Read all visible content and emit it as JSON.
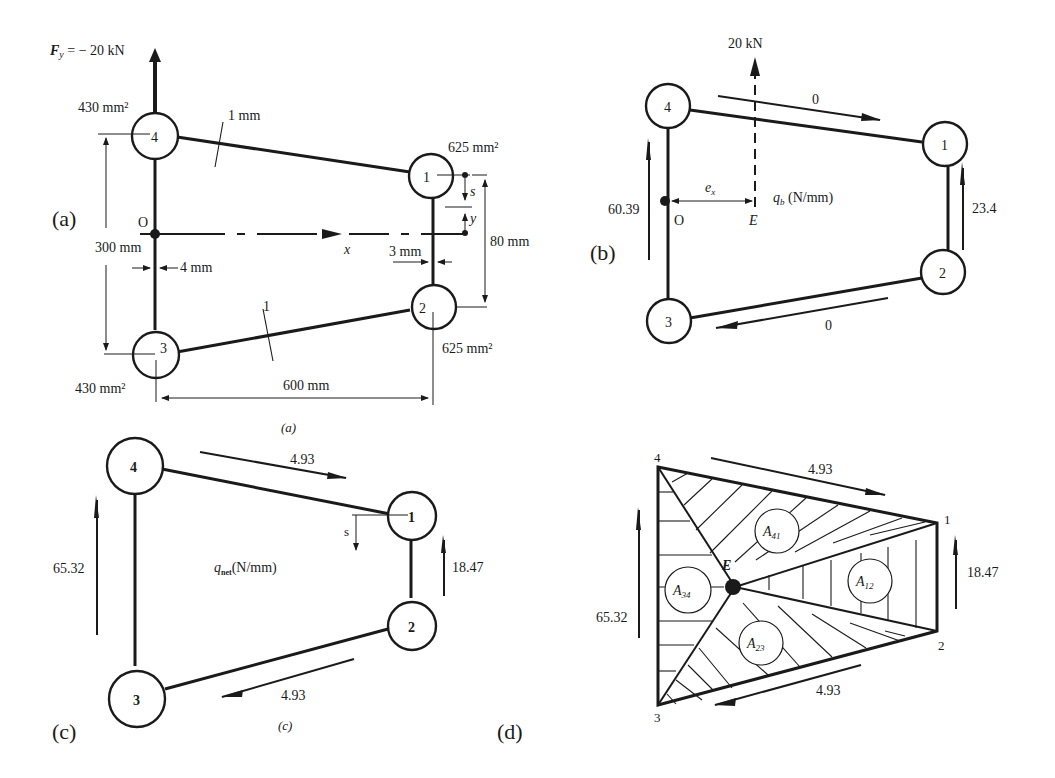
{
  "panels": {
    "a": {
      "label": "(a)",
      "caption": "(a)",
      "force": "F",
      "force_sub": "y",
      "force_value": " = − 20 kN",
      "area_4": "430 mm²",
      "area_3": "430 mm²",
      "area_1": "625 mm²",
      "area_2": "625 mm²",
      "skin_top_thickness": "1 mm",
      "skin_bottom_thickness": "1",
      "web_left_thickness": "4 mm",
      "web_right_thickness": "3 mm",
      "height_left": "300 mm",
      "height_right": "80 mm",
      "width": "600 mm",
      "origin": "O",
      "x_axis": "x",
      "s_label": "s",
      "y_label": "y",
      "booms": [
        "1",
        "2",
        "3",
        "4"
      ]
    },
    "b": {
      "label": "(b)",
      "force": "20 kN",
      "flow_41": "0",
      "flow_23": "0",
      "flow_34": "60.39",
      "flow_12": "23.4",
      "ex": "e",
      "ex_sub": "x",
      "origin": "O",
      "shear_centre": "E",
      "qb": "q",
      "qb_sub": "b",
      "qb_unit": " (N/mm)",
      "booms": [
        "1",
        "2",
        "3",
        "4"
      ]
    },
    "c": {
      "label": "(c)",
      "caption": "(c)",
      "flow_41": "4.93",
      "flow_23": "4.93",
      "flow_34": "65.32",
      "flow_12": "18.47",
      "s_label": "s",
      "qnet": "q",
      "qnet_sub": "net",
      "qnet_unit": "(N/mm)",
      "booms": [
        "1",
        "2",
        "3",
        "4"
      ]
    },
    "d": {
      "label": "(d)",
      "flow_41": "4.93",
      "flow_23": "4.93",
      "flow_34": "65.32",
      "flow_12": "18.47",
      "point_E": "E",
      "areas": [
        {
          "name": "A",
          "sub": "41"
        },
        {
          "name": "A",
          "sub": "12"
        },
        {
          "name": "A",
          "sub": "34"
        },
        {
          "name": "A",
          "sub": "23"
        }
      ],
      "corners": [
        "1",
        "2",
        "3",
        "4"
      ]
    }
  }
}
